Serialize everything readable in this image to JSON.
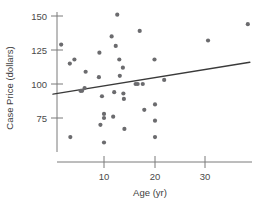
{
  "chart_data": {
    "type": "scatter",
    "title": "",
    "xlabel": "Age (yr)",
    "ylabel": "Case Price (dollars)",
    "xlim": [
      0,
      40
    ],
    "ylim": [
      55,
      158
    ],
    "grid": false,
    "legend": null,
    "xticks": [
      10,
      20,
      30
    ],
    "xtick_labels": [
      "10",
      "20",
      "30"
    ],
    "yticks": [
      75,
      100,
      125,
      150
    ],
    "ytick_labels": [
      "75",
      "100",
      "125",
      "150"
    ],
    "points": [
      {
        "x": 1.6,
        "y": 129
      },
      {
        "x": 3.3,
        "y": 115
      },
      {
        "x": 4.2,
        "y": 118
      },
      {
        "x": 3.4,
        "y": 61
      },
      {
        "x": 5.4,
        "y": 95
      },
      {
        "x": 5.7,
        "y": 95
      },
      {
        "x": 6.2,
        "y": 97
      },
      {
        "x": 6.4,
        "y": 109
      },
      {
        "x": 9.0,
        "y": 105
      },
      {
        "x": 9.1,
        "y": 123
      },
      {
        "x": 9.3,
        "y": 70
      },
      {
        "x": 9.6,
        "y": 91
      },
      {
        "x": 10.0,
        "y": 78
      },
      {
        "x": 10.0,
        "y": 75
      },
      {
        "x": 10.0,
        "y": 57
      },
      {
        "x": 11.5,
        "y": 135
      },
      {
        "x": 11.8,
        "y": 76
      },
      {
        "x": 12.0,
        "y": 94
      },
      {
        "x": 12.3,
        "y": 128
      },
      {
        "x": 12.6,
        "y": 151
      },
      {
        "x": 13.0,
        "y": 118
      },
      {
        "x": 13.1,
        "y": 106
      },
      {
        "x": 13.7,
        "y": 112
      },
      {
        "x": 13.8,
        "y": 93
      },
      {
        "x": 13.9,
        "y": 89
      },
      {
        "x": 14.0,
        "y": 67
      },
      {
        "x": 16.2,
        "y": 100
      },
      {
        "x": 16.6,
        "y": 100
      },
      {
        "x": 17.0,
        "y": 139
      },
      {
        "x": 17.6,
        "y": 100
      },
      {
        "x": 17.9,
        "y": 81
      },
      {
        "x": 19.9,
        "y": 118
      },
      {
        "x": 20.0,
        "y": 85
      },
      {
        "x": 20.0,
        "y": 73
      },
      {
        "x": 20.0,
        "y": 61
      },
      {
        "x": 21.8,
        "y": 103
      },
      {
        "x": 30.4,
        "y": 132
      },
      {
        "x": 38.2,
        "y": 144
      }
    ],
    "trendline": {
      "x_start": 0.0,
      "y_start": 92.5,
      "x_end": 38.6,
      "y_end": 116.0
    }
  }
}
